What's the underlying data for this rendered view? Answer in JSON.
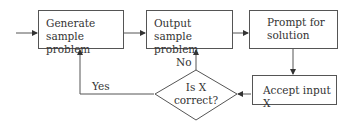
{
  "flowchart": {
    "nodes": [
      {
        "id": "generate",
        "shape": "rectangle",
        "lines": [
          "Generate",
          "sample problem"
        ]
      },
      {
        "id": "output",
        "shape": "rectangle",
        "lines": [
          "Output",
          "sample problem"
        ]
      },
      {
        "id": "prompt",
        "shape": "rectangle",
        "lines": [
          "Prompt for",
          "solution"
        ]
      },
      {
        "id": "accept",
        "shape": "rectangle",
        "lines": [
          "Accept input X"
        ]
      },
      {
        "id": "decision",
        "shape": "diamond",
        "lines": [
          "Is X",
          "correct?"
        ]
      }
    ],
    "edges": [
      {
        "from": "start",
        "to": "generate",
        "label": ""
      },
      {
        "from": "generate",
        "to": "output",
        "label": ""
      },
      {
        "from": "output",
        "to": "prompt",
        "label": ""
      },
      {
        "from": "prompt",
        "to": "accept",
        "label": ""
      },
      {
        "from": "accept",
        "to": "decision",
        "label": ""
      },
      {
        "from": "decision",
        "to": "output",
        "label": "No"
      },
      {
        "from": "decision",
        "to": "generate",
        "label": "Yes"
      }
    ],
    "labels": {
      "no": "No",
      "yes": "Yes"
    },
    "colors": {
      "line": "#555555",
      "text": "#333333",
      "background": "#ffffff"
    }
  }
}
